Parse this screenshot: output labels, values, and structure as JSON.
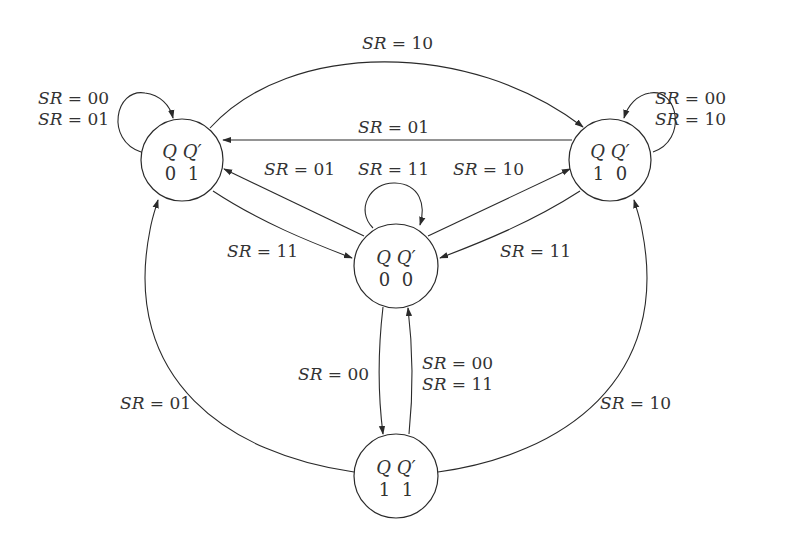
{
  "colors": {
    "stroke": "#2a2a2a",
    "text": "#333333",
    "background": "#ffffff"
  },
  "states": [
    {
      "id": "s01",
      "header": "Q Q′",
      "value": "0  1",
      "cx": 182,
      "cy": 160
    },
    {
      "id": "s10",
      "header": "Q Q′",
      "value": "1  0",
      "cx": 610,
      "cy": 160
    },
    {
      "id": "s00",
      "header": "Q Q′",
      "value": "0  0",
      "cx": 396,
      "cy": 266
    },
    {
      "id": "s11",
      "header": "Q Q′",
      "value": "1  1",
      "cx": 396,
      "cy": 476
    }
  ],
  "transitions": [
    {
      "from": "01",
      "to": "01",
      "labels": [
        "SR = 00",
        "SR = 01"
      ]
    },
    {
      "from": "10",
      "to": "10",
      "labels": [
        "SR = 00",
        "SR = 10"
      ]
    },
    {
      "from": "00",
      "to": "00",
      "labels": [
        "SR = 11"
      ]
    },
    {
      "from": "01",
      "to": "10",
      "labels": [
        "SR = 10"
      ]
    },
    {
      "from": "10",
      "to": "01",
      "labels": [
        "SR = 01"
      ]
    },
    {
      "from": "00",
      "to": "01",
      "labels": [
        "SR = 01"
      ]
    },
    {
      "from": "00",
      "to": "10",
      "labels": [
        "SR = 10"
      ]
    },
    {
      "from": "01",
      "to": "00",
      "labels": [
        "SR = 11"
      ]
    },
    {
      "from": "10",
      "to": "00",
      "labels": [
        "SR = 11"
      ]
    },
    {
      "from": "00",
      "to": "11",
      "labels": [
        "SR = 00"
      ]
    },
    {
      "from": "11",
      "to": "00",
      "labels": [
        "SR = 00",
        "SR = 11"
      ]
    },
    {
      "from": "11",
      "to": "01",
      "labels": [
        "SR = 01"
      ]
    },
    {
      "from": "11",
      "to": "10",
      "labels": [
        "SR = 10"
      ]
    }
  ],
  "labels": {
    "top_10": "SR = 10",
    "loop01_a": "SR = 00",
    "loop01_b": "SR = 01",
    "loop10_a": "SR = 00",
    "loop10_b": "SR = 10",
    "mid_01": "SR = 01",
    "c_to_01": "SR = 01",
    "loop00": "SR = 11",
    "c_to_10": "SR = 10",
    "s01_to_c": "SR = 11",
    "s10_to_c": "SR = 11",
    "c_to_11": "SR = 00",
    "s11_to_c_a": "SR = 00",
    "s11_to_c_b": "SR = 11",
    "s11_to_01": "SR = 01",
    "s11_to_10": "SR = 10"
  }
}
